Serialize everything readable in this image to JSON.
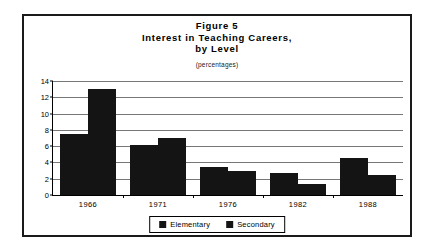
{
  "figure": {
    "title_line_1": "Figure 5",
    "title_line_2": "Interest in Teaching Careers,",
    "title_line_3": "by Level",
    "subtitle": "(percentages)"
  },
  "colors": {
    "bar": "#141414",
    "frame": "#1a1a1a",
    "grid": "#777777",
    "axis": "#000000",
    "background": "#ffffff"
  },
  "chart_data": {
    "type": "bar",
    "subtitle": "(percentages)",
    "categories": [
      "1966",
      "1971",
      "1976",
      "1982",
      "1988"
    ],
    "series": [
      {
        "name": "Elementary",
        "values": [
          7.5,
          6.2,
          3.4,
          2.7,
          4.6
        ]
      },
      {
        "name": "Secondary",
        "values": [
          13.0,
          7.0,
          3.0,
          1.3,
          2.4
        ]
      }
    ],
    "xlabel": "",
    "ylabel": "",
    "ylim": [
      0,
      14
    ],
    "yticks": [
      0,
      2,
      4,
      6,
      8,
      10,
      12,
      14
    ],
    "ytick_labels": [
      "0",
      "2",
      "4",
      "6",
      "8",
      "10",
      "12",
      "14"
    ],
    "grid": true,
    "legend_position": "bottom"
  }
}
